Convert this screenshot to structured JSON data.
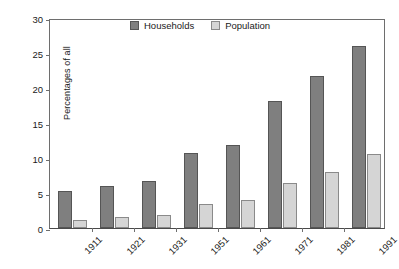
{
  "chart_data": {
    "type": "bar",
    "title": "",
    "subtitle": "",
    "xlabel": "",
    "ylabel": "Percentages of all",
    "categories": [
      "1911",
      "1921",
      "1931",
      "1951",
      "1961",
      "1971",
      "1981",
      "1991"
    ],
    "series": [
      {
        "name": "Households",
        "color": "#7f7f7f",
        "values": [
          5.3,
          6.0,
          6.7,
          10.7,
          11.9,
          18.1,
          21.7,
          26.0
        ]
      },
      {
        "name": "Population",
        "color": "#d5d5d5",
        "values": [
          1.1,
          1.6,
          1.9,
          3.4,
          4.0,
          6.4,
          8.0,
          10.6
        ]
      }
    ],
    "ylim": [
      0,
      30
    ],
    "yticks": [
      0,
      5,
      10,
      15,
      20,
      25,
      30
    ],
    "ytick_labels": [
      "0",
      "5",
      "10",
      "15",
      "20",
      "25",
      "30"
    ],
    "grid": false,
    "legend_position": "top-center",
    "x_tick_label_rotation": -45
  }
}
